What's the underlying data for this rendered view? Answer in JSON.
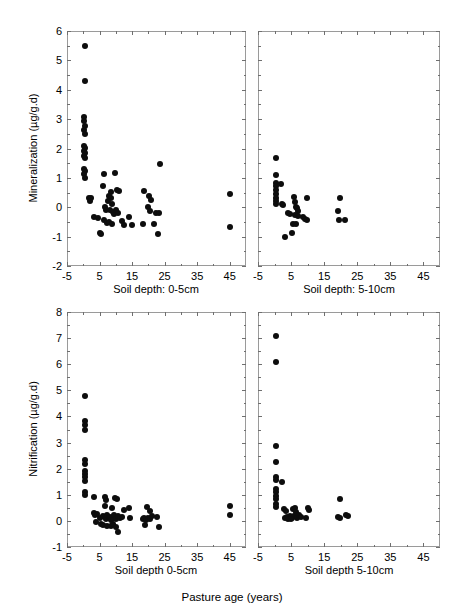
{
  "figure": {
    "xlabel_overall": "Pasture age (years)"
  },
  "chart_data": [
    {
      "id": "mineralization-0-5cm",
      "type": "scatter",
      "title": "",
      "panel_label": "Soil depth: 0-5cm",
      "xlabel": "Soil depth: 0-5cm",
      "ylabel": "Mineralization (µg/g.d)",
      "xlim": [
        -5,
        50
      ],
      "ylim": [
        -2,
        6
      ],
      "xticks": [
        -5,
        5,
        15,
        25,
        35,
        45
      ],
      "yticks": [
        -2,
        -1,
        0,
        1,
        2,
        3,
        4,
        5,
        6
      ],
      "grid": false,
      "legend": "none",
      "marker": "filled-circle",
      "color": "#0d0d0d",
      "points": [
        [
          0.4,
          5.48
        ],
        [
          0.4,
          4.3
        ],
        [
          0.3,
          3.08
        ],
        [
          0.3,
          2.92
        ],
        [
          0.5,
          2.78
        ],
        [
          0.3,
          2.62
        ],
        [
          0.4,
          2.5
        ],
        [
          0.3,
          2.1
        ],
        [
          0.5,
          2.02
        ],
        [
          0.3,
          1.92
        ],
        [
          0.6,
          1.86
        ],
        [
          0.3,
          1.74
        ],
        [
          0.5,
          1.66
        ],
        [
          0.3,
          1.3
        ],
        [
          0.5,
          1.22
        ],
        [
          0.3,
          1.12
        ],
        [
          0.4,
          0.98
        ],
        [
          1.8,
          0.32
        ],
        [
          2.0,
          0.22
        ],
        [
          2.4,
          0.3
        ],
        [
          6.5,
          1.14
        ],
        [
          9.8,
          1.16
        ],
        [
          23.5,
          1.48
        ],
        [
          6.2,
          0.72
        ],
        [
          8.6,
          0.52
        ],
        [
          10.5,
          0.58
        ],
        [
          11.0,
          0.56
        ],
        [
          8.0,
          0.4
        ],
        [
          8.4,
          0.3
        ],
        [
          7.6,
          0.2
        ],
        [
          8.8,
          0.1
        ],
        [
          6.6,
          0.0
        ],
        [
          7.0,
          -0.08
        ],
        [
          8.2,
          -0.1
        ],
        [
          9.0,
          -0.16
        ],
        [
          9.4,
          -0.22
        ],
        [
          10.2,
          -0.1
        ],
        [
          10.6,
          -0.18
        ],
        [
          3.4,
          -0.32
        ],
        [
          4.4,
          -0.36
        ],
        [
          6.4,
          -0.42
        ],
        [
          7.4,
          -0.52
        ],
        [
          8.0,
          -0.5
        ],
        [
          8.8,
          -0.56
        ],
        [
          12.0,
          -0.46
        ],
        [
          12.6,
          -0.6
        ],
        [
          14.2,
          -0.34
        ],
        [
          15.0,
          -0.6
        ],
        [
          5.0,
          -0.86
        ],
        [
          5.6,
          -0.9
        ],
        [
          18.6,
          0.54
        ],
        [
          20.2,
          0.38
        ],
        [
          20.8,
          0.26
        ],
        [
          20.0,
          0.02
        ],
        [
          20.4,
          -0.12
        ],
        [
          22.4,
          -0.18
        ],
        [
          23.4,
          -0.18
        ],
        [
          18.2,
          -0.56
        ],
        [
          21.6,
          -0.58
        ],
        [
          23.0,
          -0.9
        ],
        [
          45.0,
          0.45
        ],
        [
          45.0,
          -0.66
        ]
      ]
    },
    {
      "id": "mineralization-5-10cm",
      "type": "scatter",
      "title": "",
      "panel_label": "Soil depth: 5-10cm",
      "xlabel": "Soil depth: 5-10cm",
      "ylabel": "",
      "xlim": [
        -5,
        50
      ],
      "ylim": [
        -2,
        6
      ],
      "xticks": [
        -5,
        5,
        15,
        25,
        35,
        45
      ],
      "yticks": [
        -2,
        -1,
        0,
        1,
        2,
        3,
        4,
        5,
        6
      ],
      "grid": false,
      "legend": "none",
      "marker": "filled-circle",
      "color": "#0d0d0d",
      "points": [
        [
          0.4,
          1.68
        ],
        [
          0.4,
          1.1
        ],
        [
          0.3,
          0.82
        ],
        [
          0.5,
          0.72
        ],
        [
          2.0,
          0.78
        ],
        [
          0.3,
          0.58
        ],
        [
          0.4,
          0.46
        ],
        [
          0.3,
          0.3
        ],
        [
          0.4,
          0.22
        ],
        [
          0.5,
          0.12
        ],
        [
          2.2,
          0.1
        ],
        [
          2.6,
          0.06
        ],
        [
          6.0,
          0.34
        ],
        [
          6.2,
          0.18
        ],
        [
          9.8,
          0.32
        ],
        [
          6.4,
          0.02
        ],
        [
          6.8,
          -0.02
        ],
        [
          7.0,
          -0.12
        ],
        [
          4.2,
          -0.2
        ],
        [
          4.8,
          -0.24
        ],
        [
          6.2,
          -0.28
        ],
        [
          7.2,
          -0.3
        ],
        [
          8.6,
          -0.34
        ],
        [
          9.2,
          -0.4
        ],
        [
          9.8,
          -0.42
        ],
        [
          5.6,
          -0.56
        ],
        [
          6.6,
          -0.58
        ],
        [
          3.2,
          -1.02
        ],
        [
          5.4,
          -0.88
        ],
        [
          19.8,
          0.3
        ],
        [
          19.2,
          -0.14
        ],
        [
          19.6,
          -0.42
        ],
        [
          21.4,
          -0.44
        ]
      ]
    },
    {
      "id": "nitrification-0-5cm",
      "type": "scatter",
      "title": "",
      "panel_label": "Soil depth 0-5cm",
      "xlabel": "Soil depth 0-5cm",
      "ylabel": "Nitrification (µg/g.d)",
      "xlim": [
        -5,
        50
      ],
      "ylim": [
        -1,
        8
      ],
      "xticks": [
        -5,
        5,
        15,
        25,
        35,
        45
      ],
      "yticks": [
        -1,
        0,
        1,
        2,
        3,
        4,
        5,
        6,
        7,
        8
      ],
      "grid": false,
      "legend": "none",
      "marker": "filled-circle",
      "color": "#0d0d0d",
      "points": [
        [
          0.4,
          4.78
        ],
        [
          0.4,
          3.82
        ],
        [
          0.4,
          3.66
        ],
        [
          0.4,
          3.5
        ],
        [
          0.4,
          2.32
        ],
        [
          0.4,
          2.16
        ],
        [
          0.4,
          1.92
        ],
        [
          0.4,
          1.8
        ],
        [
          0.4,
          1.68
        ],
        [
          0.4,
          1.54
        ],
        [
          0.4,
          1.1
        ],
        [
          0.4,
          0.98
        ],
        [
          3.4,
          0.92
        ],
        [
          6.6,
          0.92
        ],
        [
          7.0,
          0.8
        ],
        [
          9.8,
          0.88
        ],
        [
          10.4,
          0.84
        ],
        [
          6.8,
          0.58
        ],
        [
          8.8,
          0.5
        ],
        [
          12.6,
          0.42
        ],
        [
          14.0,
          0.48
        ],
        [
          19.6,
          0.52
        ],
        [
          20.4,
          0.38
        ],
        [
          3.2,
          0.3
        ],
        [
          3.6,
          0.22
        ],
        [
          4.2,
          0.26
        ],
        [
          5.0,
          0.12
        ],
        [
          6.0,
          0.2
        ],
        [
          6.6,
          0.14
        ],
        [
          7.0,
          0.08
        ],
        [
          7.4,
          0.22
        ],
        [
          7.8,
          0.1
        ],
        [
          8.2,
          0.16
        ],
        [
          8.6,
          0.04
        ],
        [
          9.0,
          0.12
        ],
        [
          9.4,
          0.24
        ],
        [
          10.0,
          0.06
        ],
        [
          10.6,
          0.18
        ],
        [
          11.2,
          0.1
        ],
        [
          12.0,
          0.14
        ],
        [
          14.4,
          0.1
        ],
        [
          18.2,
          0.06
        ],
        [
          18.8,
          0.1
        ],
        [
          19.4,
          0.04
        ],
        [
          20.0,
          0.12
        ],
        [
          20.6,
          0.08
        ],
        [
          21.0,
          0.2
        ],
        [
          22.6,
          0.14
        ],
        [
          3.8,
          -0.04
        ],
        [
          5.4,
          -0.1
        ],
        [
          6.2,
          -0.16
        ],
        [
          7.2,
          -0.2
        ],
        [
          8.4,
          -0.18
        ],
        [
          9.2,
          -0.12
        ],
        [
          10.2,
          -0.24
        ],
        [
          19.0,
          -0.14
        ],
        [
          23.2,
          -0.22
        ],
        [
          10.8,
          -0.42
        ],
        [
          45.0,
          0.58
        ],
        [
          45.0,
          0.22
        ]
      ]
    },
    {
      "id": "nitrification-5-10cm",
      "type": "scatter",
      "title": "",
      "panel_label": "Soil depth 5-10cm",
      "xlabel": "Soil depth 5-10cm",
      "ylabel": "",
      "xlim": [
        -5,
        50
      ],
      "ylim": [
        -1,
        8
      ],
      "xticks": [
        -5,
        5,
        15,
        25,
        35,
        45
      ],
      "yticks": [
        -1,
        0,
        1,
        2,
        3,
        4,
        5,
        6,
        7,
        8
      ],
      "grid": false,
      "legend": "none",
      "marker": "filled-circle",
      "color": "#0d0d0d",
      "points": [
        [
          0.4,
          7.08
        ],
        [
          0.4,
          6.1
        ],
        [
          0.4,
          2.88
        ],
        [
          0.4,
          2.24
        ],
        [
          0.4,
          1.7
        ],
        [
          0.4,
          1.56
        ],
        [
          2.4,
          1.5
        ],
        [
          0.4,
          1.24
        ],
        [
          0.4,
          1.1
        ],
        [
          0.4,
          0.96
        ],
        [
          0.4,
          0.82
        ],
        [
          0.4,
          0.66
        ],
        [
          0.4,
          0.52
        ],
        [
          19.8,
          0.84
        ],
        [
          3.0,
          0.44
        ],
        [
          3.6,
          0.36
        ],
        [
          5.6,
          0.44
        ],
        [
          6.2,
          0.5
        ],
        [
          6.6,
          0.34
        ],
        [
          10.0,
          0.48
        ],
        [
          10.4,
          0.4
        ],
        [
          4.6,
          0.2
        ],
        [
          5.2,
          0.12
        ],
        [
          6.0,
          0.18
        ],
        [
          6.8,
          0.1
        ],
        [
          7.4,
          0.22
        ],
        [
          8.0,
          0.14
        ],
        [
          9.6,
          0.12
        ],
        [
          3.2,
          0.1
        ],
        [
          3.8,
          0.16
        ],
        [
          4.2,
          0.08
        ],
        [
          5.0,
          0.06
        ],
        [
          19.2,
          0.16
        ],
        [
          19.8,
          0.1
        ],
        [
          21.6,
          0.22
        ],
        [
          22.2,
          0.18
        ]
      ]
    }
  ]
}
